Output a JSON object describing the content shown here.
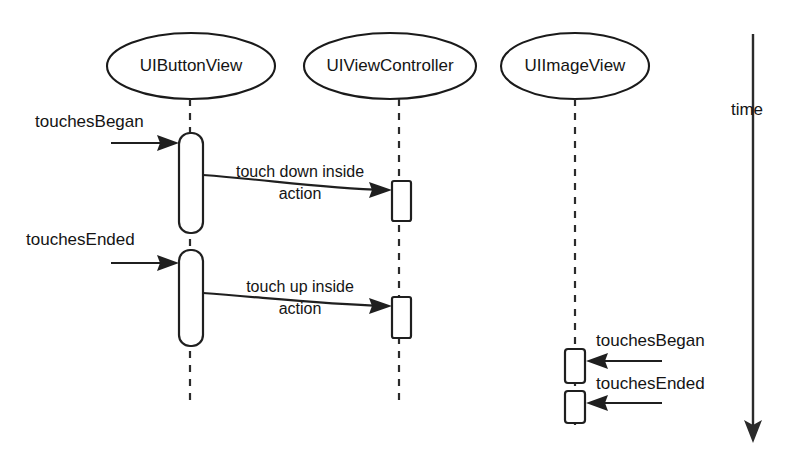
{
  "diagram": {
    "kind": "uml-sequence-diagram",
    "time_axis": {
      "label": "time",
      "direction": "downward"
    },
    "lifelines": [
      {
        "id": "uibuttonview",
        "label": "UIButtonView",
        "head_cx": 191,
        "head_cy": 66,
        "head_rx": 84,
        "head_ry": 33,
        "line_x": 190,
        "line_top": 99,
        "line_bottom": 406,
        "activations": [
          {
            "x": 179,
            "y": 133,
            "w": 24,
            "h": 100,
            "rounded": true
          },
          {
            "x": 179,
            "y": 250,
            "w": 24,
            "h": 96,
            "rounded": true
          }
        ]
      },
      {
        "id": "uiviewcontroller",
        "label": "UIViewController",
        "head_cx": 390,
        "head_cy": 66,
        "head_rx": 86,
        "head_ry": 33,
        "line_x": 399,
        "line_top": 99,
        "line_bottom": 406,
        "activations": [
          {
            "x": 392,
            "y": 181,
            "w": 19,
            "h": 40,
            "rounded": false
          },
          {
            "x": 392,
            "y": 297,
            "w": 19,
            "h": 41,
            "rounded": false
          }
        ]
      },
      {
        "id": "uiimageview",
        "label": "UIImageView",
        "head_cx": 575,
        "head_cy": 66,
        "head_rx": 74,
        "head_ry": 33,
        "line_x": 575,
        "line_top": 99,
        "line_bottom": 425,
        "activations": [
          {
            "x": 565,
            "y": 349,
            "w": 20,
            "h": 34,
            "rounded": false
          },
          {
            "x": 565,
            "y": 391,
            "w": 20,
            "h": 32,
            "rounded": false
          }
        ]
      }
    ],
    "messages": [
      {
        "id": "touches-began-button",
        "label": "touchesBegan",
        "label_x": 35,
        "label_y": 127,
        "from_x": 111,
        "from_y": 143,
        "to_x": 179,
        "to_y": 143,
        "direction": "right",
        "style": "straight"
      },
      {
        "id": "touch-down-inside-action",
        "label_line1": "touch down inside",
        "label_line2": "action",
        "label_x": 300,
        "label_y1": 177,
        "label_y2": 199,
        "from_x": 203,
        "from_y": 175,
        "to_x": 392,
        "to_y": 190,
        "direction": "right",
        "style": "curved"
      },
      {
        "id": "touches-ended-button",
        "label": "touchesEnded",
        "label_x": 26,
        "label_y": 245,
        "from_x": 111,
        "from_y": 263,
        "to_x": 179,
        "to_y": 263,
        "direction": "right",
        "style": "straight"
      },
      {
        "id": "touch-up-inside-action",
        "label_line1": "touch up inside",
        "label_line2": "action",
        "label_x": 300,
        "label_y1": 292,
        "label_y2": 314,
        "from_x": 203,
        "from_y": 293,
        "to_x": 392,
        "to_y": 306,
        "direction": "right",
        "style": "curved"
      },
      {
        "id": "touches-began-image",
        "label": "touchesBegan",
        "label_x": 596,
        "label_y": 346,
        "from_x": 662,
        "from_y": 361,
        "to_x": 586,
        "to_y": 361,
        "direction": "left",
        "style": "straight"
      },
      {
        "id": "touches-ended-image",
        "label": "touchesEnded",
        "label_x": 596,
        "label_y": 389,
        "from_x": 662,
        "from_y": 403,
        "to_x": 586,
        "to_y": 403,
        "direction": "left",
        "style": "straight"
      }
    ],
    "colors": {
      "stroke": "#1f1f1f",
      "text": "#141414",
      "background": "#ffffff"
    }
  }
}
